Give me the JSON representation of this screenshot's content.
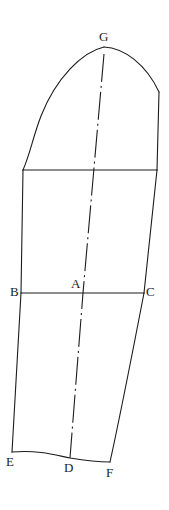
{
  "figure": {
    "kind": "technical-line-drawing",
    "background_color": "#ffffff",
    "ink_color": "#1c1c1c",
    "width": 169,
    "height": 510
  },
  "labels": {
    "g": "G",
    "a": "A",
    "b": "B",
    "c": "C",
    "d": "D",
    "e": "E",
    "f": "F"
  },
  "points": {
    "g": {
      "x": 104,
      "y": 47,
      "label_x": 99,
      "label_y": 30
    },
    "a": {
      "x": 83,
      "y": 293,
      "label_x": 71,
      "label_y": 277
    },
    "b": {
      "x": 21,
      "y": 293,
      "label_x": 10,
      "label_y": 285
    },
    "c": {
      "x": 144,
      "y": 293,
      "label_x": 146,
      "label_y": 285
    },
    "d": {
      "x": 70,
      "y": 458,
      "label_x": 64,
      "label_y": 461
    },
    "e": {
      "x": 12,
      "y": 452,
      "label_x": 6,
      "label_y": 455
    },
    "f": {
      "x": 110,
      "y": 462,
      "label_x": 106,
      "label_y": 466
    }
  },
  "geometry": {
    "cap_apex_to_right_corner": "M 104 47 C 124 48 146 64 159 92",
    "cap_apex_to_left_notch": "M 104 47 C 82 52 56 78 41 116 C 33 137 30 154 23 170",
    "right_upper_seam": "M 159 92 L 157 170",
    "left_upper_to_bicep": "M 23 170 L 21 293",
    "right_bicep_seam": "M 157 170 L 144 293",
    "bicep_line": "M 23 170 L 157 170",
    "underarm_line_b_to_c": "M 21 293 L 144 293",
    "left_lower_seam": "M 21 293 C 18 350 15 405 12 452",
    "right_lower_seam": "M 144 293 C 133 350 121 412 110 462",
    "hem_curve": "M 12 452 C 40 450 55 455 70 458 C 88 461 99 462 110 462",
    "grainline": "M 104 54 L 83 293 L 70 458"
  },
  "style": {
    "stroke_width": 1.1,
    "grainline_dash": "28 4 2 4"
  }
}
